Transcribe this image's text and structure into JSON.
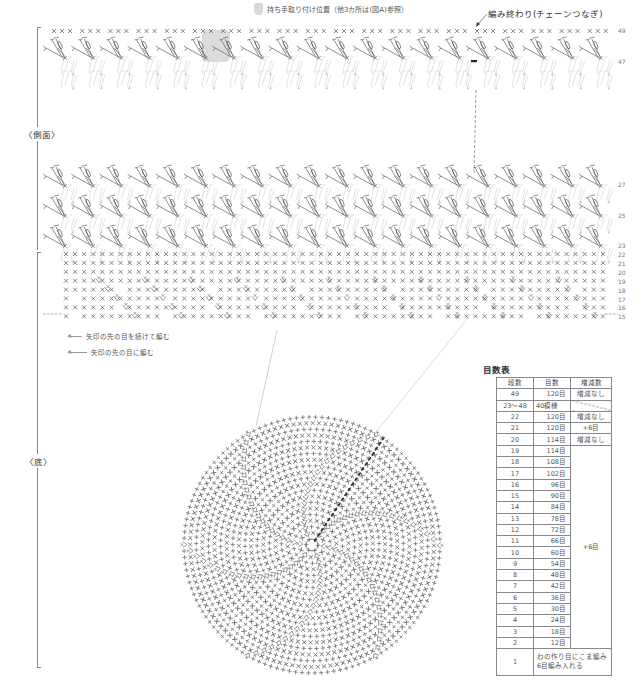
{
  "header": {
    "handle_position_note": "持ち手取り付け位置（他3カ所は(図A)参照）",
    "end_note": "編み終わり(チェーンつなぎ)"
  },
  "sections": {
    "side_label": "〈側面〉",
    "bottom_label": "〈底〉"
  },
  "row_numbers": {
    "top_block": [
      "49",
      "47"
    ],
    "middle_block": [
      "27",
      "25",
      "23"
    ],
    "sc_block": [
      "22",
      "21",
      "20",
      "19",
      "18",
      "17",
      "16",
      "15"
    ]
  },
  "legend": [
    {
      "icon": "arrow-left-icon",
      "text": "矢印の先の目を続けて編む"
    },
    {
      "icon": "arrow-left-icon",
      "text": "矢印の先の目に編む"
    }
  ],
  "stitch_table": {
    "title": "目数表",
    "headers": [
      "段数",
      "目数",
      "増減数"
    ],
    "rows": [
      {
        "row": "49",
        "count": "120目",
        "change": "増減なし"
      },
      {
        "row": "23～48",
        "count": "40模様",
        "change": ""
      },
      {
        "row": "22",
        "count": "120目",
        "change": "増減なし"
      },
      {
        "row": "21",
        "count": "120目",
        "change": "+6目"
      },
      {
        "row": "20",
        "count": "114目",
        "change": "増減なし"
      },
      {
        "row": "19",
        "count": "114目"
      },
      {
        "row": "18",
        "count": "108目"
      },
      {
        "row": "17",
        "count": "102目"
      },
      {
        "row": "16",
        "count": "96目"
      },
      {
        "row": "15",
        "count": "90目"
      },
      {
        "row": "14",
        "count": "84目"
      },
      {
        "row": "13",
        "count": "78目"
      },
      {
        "row": "12",
        "count": "72目"
      },
      {
        "row": "11",
        "count": "66目"
      },
      {
        "row": "10",
        "count": "60目"
      },
      {
        "row": "9",
        "count": "54目"
      },
      {
        "row": "8",
        "count": "48目"
      },
      {
        "row": "7",
        "count": "42目"
      },
      {
        "row": "6",
        "count": "36目"
      },
      {
        "row": "5",
        "count": "30目"
      },
      {
        "row": "4",
        "count": "24目"
      },
      {
        "row": "3",
        "count": "18目"
      },
      {
        "row": "2",
        "count": "12目"
      }
    ],
    "merged_change_2_19": "+6目",
    "first_row": {
      "row": "1",
      "text_line1": "わの作り目にこま編み",
      "text_line2": "6目編み入れる"
    }
  },
  "colors": {
    "line": "#888888",
    "symbol_dark": "#444444",
    "symbol_light": "#c8c8c8",
    "handle_highlight": "#d8d8d8"
  }
}
